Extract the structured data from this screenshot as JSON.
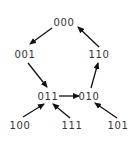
{
  "diagram": {
    "type": "state-transition-graph",
    "colors": {
      "background": "#ffffff",
      "edge": "#111111",
      "label": "#333333"
    },
    "nodes": [
      {
        "id": "000",
        "label": "000",
        "x": 64,
        "y": 26
      },
      {
        "id": "001",
        "label": "001",
        "x": 25,
        "y": 58
      },
      {
        "id": "110",
        "label": "110",
        "x": 99,
        "y": 58
      },
      {
        "id": "011",
        "label": "011",
        "x": 48,
        "y": 100
      },
      {
        "id": "010",
        "label": "010",
        "x": 89,
        "y": 100
      },
      {
        "id": "100",
        "label": "100",
        "x": 20,
        "y": 129
      },
      {
        "id": "111",
        "label": "111",
        "x": 72,
        "y": 129
      },
      {
        "id": "101",
        "label": "101",
        "x": 118,
        "y": 129
      }
    ],
    "edges": [
      {
        "from": "000",
        "to": "001",
        "x1": 52,
        "y1": 28,
        "x2": 30,
        "y2": 44
      },
      {
        "from": "001",
        "to": "011",
        "x1": 28,
        "y1": 63,
        "x2": 47,
        "y2": 87
      },
      {
        "from": "011",
        "to": "010",
        "x1": 59,
        "y1": 96,
        "x2": 79,
        "y2": 96
      },
      {
        "from": "010",
        "to": "110",
        "x1": 91,
        "y1": 88,
        "x2": 98,
        "y2": 63
      },
      {
        "from": "110",
        "to": "000",
        "x1": 99,
        "y1": 47,
        "x2": 78,
        "y2": 27
      },
      {
        "from": "100",
        "to": "011",
        "x1": 23,
        "y1": 117,
        "x2": 44,
        "y2": 104
      },
      {
        "from": "111",
        "to": "011",
        "x1": 70,
        "y1": 118,
        "x2": 53,
        "y2": 104
      },
      {
        "from": "101",
        "to": "010",
        "x1": 117,
        "y1": 118,
        "x2": 95,
        "y2": 103
      }
    ]
  }
}
